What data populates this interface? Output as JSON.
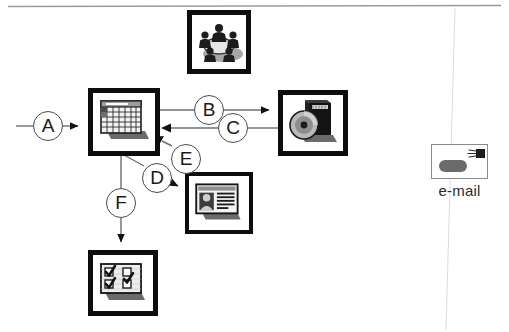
{
  "diagram": {
    "background_color": "#ffffff",
    "ink_color": "#0d0d0d",
    "line_color": "#6f6f6f",
    "rule_color": "#9a9a9a"
  },
  "nodes": [
    {
      "id": "meeting",
      "icon": "people-meeting-icon",
      "label": "",
      "x": 187,
      "y": 10,
      "width": 64,
      "height": 64
    },
    {
      "id": "spreadsheet",
      "icon": "spreadsheet-calendar-icon",
      "label": "",
      "x": 88,
      "y": 88,
      "width": 72,
      "height": 68
    },
    {
      "id": "database",
      "icon": "disc-storage-icon",
      "label": "",
      "x": 278,
      "y": 90,
      "width": 70,
      "height": 66
    },
    {
      "id": "document",
      "icon": "article-document-icon",
      "label": "",
      "x": 185,
      "y": 172,
      "width": 68,
      "height": 62
    },
    {
      "id": "checklist",
      "icon": "checklist-icon",
      "label": "",
      "x": 88,
      "y": 250,
      "width": 70,
      "height": 66
    }
  ],
  "edges": [
    {
      "id": "A",
      "label": "A",
      "label_x": 33,
      "label_y": 111,
      "from": "external-input",
      "to": "spreadsheet",
      "direction": "right"
    },
    {
      "id": "B",
      "label": "B",
      "label_x": 194,
      "label_y": 100,
      "from": "spreadsheet",
      "to": "database",
      "direction": "right"
    },
    {
      "id": "C",
      "label": "C",
      "label_x": 218,
      "label_y": 118,
      "from": "database",
      "to": "spreadsheet",
      "direction": "left"
    },
    {
      "id": "D",
      "label": "D",
      "label_x": 142,
      "label_y": 163,
      "from": "spreadsheet",
      "to": "document",
      "direction": "down-right"
    },
    {
      "id": "E",
      "label": "E",
      "label_x": 171,
      "label_y": 144,
      "from": "document",
      "to": "spreadsheet",
      "direction": "up-left"
    },
    {
      "id": "F",
      "label": "F",
      "label_x": 106,
      "label_y": 188,
      "from": "spreadsheet",
      "to": "checklist",
      "direction": "down"
    }
  ],
  "email": {
    "caption": "e-mail",
    "icon": "email-pill-icon",
    "x": 431,
    "y": 144,
    "width": 57
  },
  "rules": {
    "top_rule_y": 6,
    "vertical_hairline": true
  }
}
